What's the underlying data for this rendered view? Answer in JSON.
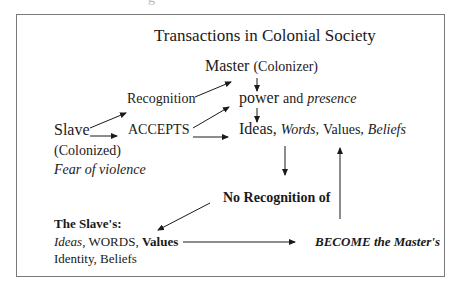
{
  "header_remnant": "g",
  "diagram": {
    "title": "Transactions in Colonial Society",
    "nodes": {
      "master": {
        "main": "Master",
        "sub": "(Colonizer)"
      },
      "recognition": {
        "label": "Recognition"
      },
      "power": {
        "main": "power",
        "joiner": "and",
        "italic": "presence"
      },
      "slave": {
        "main": "Slave",
        "line2": "(Colonized)",
        "line3": "Fear of violence"
      },
      "accepts": {
        "label": "ACCEPTS"
      },
      "ideas": {
        "w1": "Ideas,",
        "w2": "Words,",
        "w3": "Values,",
        "w4": "Beliefs"
      },
      "no_recognition": {
        "label": "No Recognition of"
      },
      "slaves_items": {
        "heading": "The Slave's:",
        "line1_italic": "Ideas,",
        "line1_plain": "WORDS,",
        "line1_bold": "Values",
        "line2": "Identity, Beliefs"
      },
      "become": {
        "label": "BECOME the Master's"
      }
    },
    "edges": [
      {
        "from": "slave",
        "to": "recognition"
      },
      {
        "from": "slave",
        "to": "accepts"
      },
      {
        "from": "recognition",
        "to": "master"
      },
      {
        "from": "accepts",
        "to": "power"
      },
      {
        "from": "accepts",
        "to": "ideas"
      },
      {
        "from": "master",
        "to": "power"
      },
      {
        "from": "power",
        "to": "ideas"
      },
      {
        "from": "ideas",
        "to": "no_recognition"
      },
      {
        "from": "no_recognition",
        "to": "slaves_items"
      },
      {
        "from": "slaves_items",
        "to": "become"
      },
      {
        "from": "become",
        "to": "ideas"
      }
    ],
    "colors": {
      "border": "#7a7a7a",
      "ink": "#1a1a1a"
    }
  }
}
